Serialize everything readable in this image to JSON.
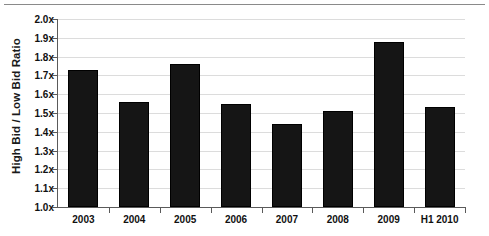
{
  "chart_data": {
    "type": "bar",
    "title": "",
    "subtitle": "",
    "xlabel": "",
    "ylabel": "High Bid / Low Bid Ratio",
    "categories": [
      "2003",
      "2004",
      "2005",
      "2006",
      "2007",
      "2008",
      "2009",
      "H1 2010"
    ],
    "values": [
      1.73,
      1.56,
      1.76,
      1.55,
      1.44,
      1.51,
      1.88,
      1.53
    ],
    "ylim": [
      1.0,
      2.0
    ],
    "ytick_values": [
      1.0,
      1.1,
      1.2,
      1.3,
      1.4,
      1.5,
      1.6,
      1.7,
      1.8,
      1.9,
      2.0
    ],
    "ytick_labels": [
      "1.0x",
      "1.1x",
      "1.2x",
      "1.3x",
      "1.4x",
      "1.5x",
      "1.6x",
      "1.7x",
      "1.8x",
      "1.9x",
      "2.0x"
    ],
    "grid": true,
    "legend": false,
    "legend_position": "none",
    "bar_color": "#151515",
    "gridline_color": "#dcdcdc",
    "axis_color": "#5a5a5a",
    "background_color": "#ffffff"
  }
}
